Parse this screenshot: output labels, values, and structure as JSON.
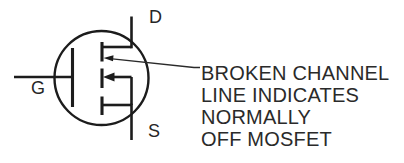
{
  "figure": {
    "background_color": "#ffffff",
    "line_color": "#1c1c1c",
    "text_color": "#2a2a2a",
    "symbol": {
      "kind": "n-channel enhancement-mode MOSFET schematic symbol",
      "drain_label": "D",
      "gate_label": "G",
      "source_label": "S"
    },
    "annotation": {
      "lines": [
        "BROKEN CHANNEL",
        "LINE INDICATES",
        "NORMALLY",
        "OFF MOSFET"
      ]
    }
  }
}
